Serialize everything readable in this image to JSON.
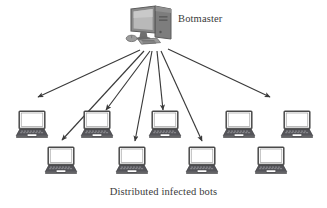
{
  "diagram": {
    "type": "botnet-topology",
    "background_color": "#ffffff",
    "stroke_color": "#3a3a3a",
    "device_body_color": "#4a4a4a",
    "device_screen_color": "#ffffff",
    "labels": {
      "botmaster": "Botmaster",
      "bots_caption": "Distributed infected bots"
    },
    "nodes": {
      "controller": {
        "name": "botmaster-computer",
        "icon": "desktop-computer-icon",
        "x": 150,
        "y": 28
      },
      "bots_row_top": [
        {
          "name": "bot-laptop-1",
          "icon": "laptop-icon",
          "x": 31,
          "y": 124
        },
        {
          "name": "bot-laptop-2",
          "icon": "laptop-icon",
          "x": 96,
          "y": 124
        },
        {
          "name": "bot-laptop-3",
          "icon": "laptop-icon",
          "x": 164,
          "y": 124
        },
        {
          "name": "bot-laptop-4",
          "icon": "laptop-icon",
          "x": 238,
          "y": 124
        },
        {
          "name": "bot-laptop-5",
          "icon": "laptop-icon",
          "x": 296,
          "y": 124
        }
      ],
      "bots_row_bottom": [
        {
          "name": "bot-laptop-6",
          "icon": "laptop-icon",
          "x": 60,
          "y": 160
        },
        {
          "name": "bot-laptop-7",
          "icon": "laptop-icon",
          "x": 131,
          "y": 160
        },
        {
          "name": "bot-laptop-8",
          "icon": "laptop-icon",
          "x": 201,
          "y": 160
        },
        {
          "name": "bot-laptop-9",
          "icon": "laptop-icon",
          "x": 270,
          "y": 160
        }
      ]
    },
    "arrows": [
      {
        "name": "command-arrow-1",
        "from": [
          140,
          50
        ],
        "to": [
          38,
          97
        ]
      },
      {
        "name": "command-arrow-2",
        "from": [
          144,
          51
        ],
        "to": [
          62,
          140
        ]
      },
      {
        "name": "command-arrow-3",
        "from": [
          150,
          51
        ],
        "to": [
          106,
          110
        ]
      },
      {
        "name": "command-arrow-4",
        "from": [
          152,
          51
        ],
        "to": [
          135,
          141
        ]
      },
      {
        "name": "command-arrow-5",
        "from": [
          157,
          51
        ],
        "to": [
          163,
          110
        ]
      },
      {
        "name": "command-arrow-6",
        "from": [
          161,
          51
        ],
        "to": [
          202,
          141
        ]
      },
      {
        "name": "command-arrow-7",
        "from": [
          168,
          49
        ],
        "to": [
          270,
          97
        ]
      }
    ],
    "counts": {
      "total_bots": 9,
      "total_arrows": 7
    }
  }
}
